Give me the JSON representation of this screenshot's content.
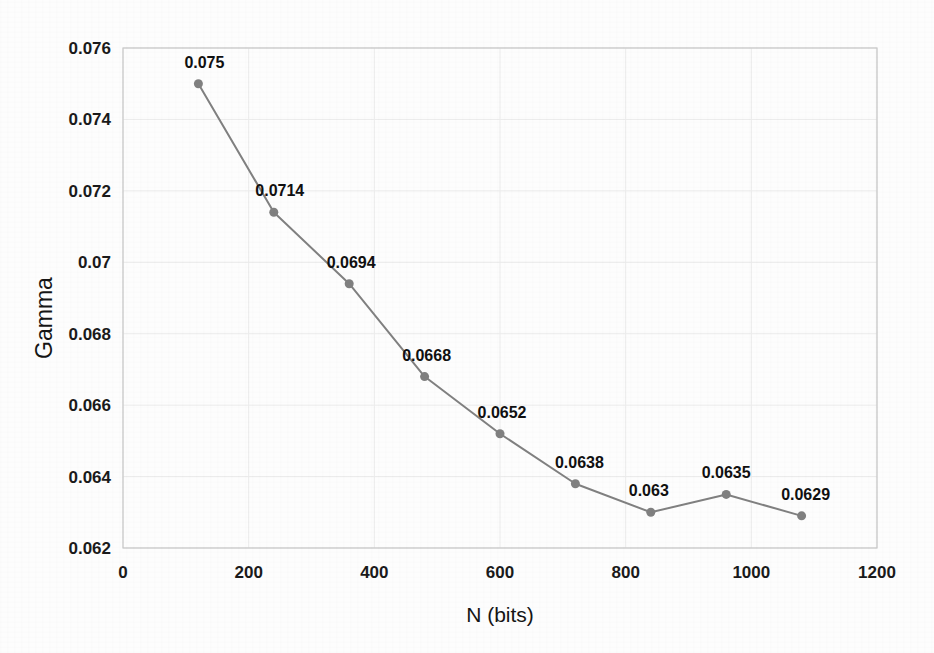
{
  "chart_data": {
    "type": "line",
    "title": "",
    "xlabel": "N (bits)",
    "ylabel": "Gamma",
    "x": [
      120,
      240,
      360,
      480,
      600,
      720,
      840,
      960,
      1080
    ],
    "values": [
      0.075,
      0.0714,
      0.0694,
      0.0668,
      0.0652,
      0.0638,
      0.063,
      0.0635,
      0.0629
    ],
    "point_labels": [
      "0.075",
      "0.0714",
      "0.0694",
      "0.0668",
      "0.0652",
      "0.0638",
      "0.063",
      "0.0635",
      "0.0629"
    ],
    "xlim": [
      0,
      1200
    ],
    "ylim": [
      0.062,
      0.076
    ],
    "xticks": [
      0,
      200,
      400,
      600,
      800,
      1000,
      1200
    ],
    "xtick_labels": [
      "0",
      "200",
      "400",
      "600",
      "800",
      "1000",
      "1200"
    ],
    "yticks": [
      0.062,
      0.064,
      0.066,
      0.068,
      0.07,
      0.072,
      0.074,
      0.076
    ],
    "ytick_labels": [
      "0.062",
      "0.064",
      "0.066",
      "0.068",
      "0.07",
      "0.072",
      "0.074",
      "0.076"
    ],
    "grid": true,
    "legend": false,
    "series_color": "#808080",
    "marker_color": "#808080",
    "grid_color": "#ebebeb",
    "axis_color": "#c9c9c9",
    "text_color": "#1a1a1a",
    "background_color": "#fdfdfd",
    "marker": "circle",
    "line_width": 2
  },
  "plot_geometry": {
    "left": 123,
    "right": 877,
    "top": 48,
    "bottom": 548
  },
  "label_offsets": [
    {
      "dx": 6,
      "dy": -16
    },
    {
      "dx": 6,
      "dy": -16
    },
    {
      "dx": 2,
      "dy": -16
    },
    {
      "dx": 2,
      "dy": -16
    },
    {
      "dx": 2,
      "dy": -16
    },
    {
      "dx": 4,
      "dy": -16
    },
    {
      "dx": -2,
      "dy": -16
    },
    {
      "dx": 0,
      "dy": -16
    },
    {
      "dx": 4,
      "dy": -16
    }
  ]
}
